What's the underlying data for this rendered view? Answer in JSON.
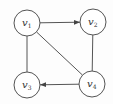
{
  "diagram": {
    "type": "graph",
    "node_radius": 13,
    "colors": {
      "stroke": "#555555",
      "text": "#333333",
      "fill": "#ffffff"
    },
    "nodes": [
      {
        "id": "v1",
        "base": "v",
        "sub": "1",
        "x": 27,
        "y": 23
      },
      {
        "id": "v2",
        "base": "v",
        "sub": "2",
        "x": 93,
        "y": 22
      },
      {
        "id": "v3",
        "base": "v",
        "sub": "3",
        "x": 27,
        "y": 85
      },
      {
        "id": "v4",
        "base": "v",
        "sub": "4",
        "x": 92,
        "y": 84
      }
    ],
    "edges": [
      {
        "from": "v1",
        "to": "v2",
        "directed": true
      },
      {
        "from": "v1",
        "to": "v3",
        "directed": false
      },
      {
        "from": "v2",
        "to": "v4",
        "directed": false
      },
      {
        "from": "v1",
        "to": "v4",
        "directed": false
      },
      {
        "from": "v4",
        "to": "v3",
        "directed": true
      }
    ]
  }
}
